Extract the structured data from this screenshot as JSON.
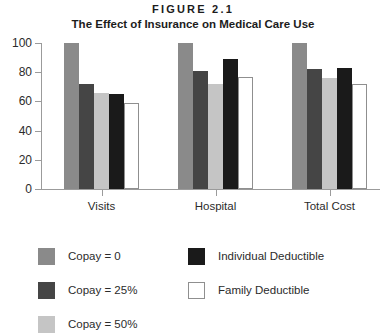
{
  "figure": {
    "number": "FIGURE  2.1",
    "title": "The Effect of Insurance on Medical Care Use"
  },
  "chart_data": {
    "type": "bar",
    "title": "The Effect of Insurance on Medical Care Use",
    "xlabel": "",
    "ylabel": "",
    "ylim": [
      0,
      100
    ],
    "yticks": [
      0,
      20,
      40,
      60,
      80,
      100
    ],
    "grid": false,
    "legend_position": "bottom",
    "categories": [
      "Visits",
      "Hospital",
      "Total Cost"
    ],
    "series": [
      {
        "name": "Copay = 0",
        "color": "#8a8a8a",
        "border": "#8a8a8a",
        "values": [
          100,
          100,
          100
        ]
      },
      {
        "name": "Copay = 25%",
        "color": "#454545",
        "border": "#454545",
        "values": [
          72,
          81,
          82
        ]
      },
      {
        "name": "Copay = 50%",
        "color": "#c5c5c5",
        "border": "#c5c5c5",
        "values": [
          66,
          72,
          76
        ]
      },
      {
        "name": "Individual Deductible",
        "color": "#1a1a1a",
        "border": "#1a1a1a",
        "values": [
          65,
          89,
          83
        ]
      },
      {
        "name": "Family Deductible",
        "color": "#ffffff",
        "border": "#8f8f8f",
        "values": [
          59,
          77,
          72
        ]
      }
    ]
  }
}
